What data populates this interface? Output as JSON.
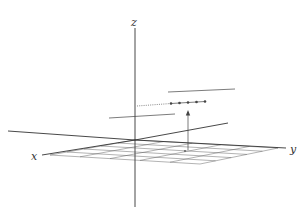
{
  "diagram": {
    "type": "3d-coordinate-axes",
    "axis_labels": {
      "x": "x",
      "y": "y",
      "z": "z"
    },
    "grid": {
      "rows": 5,
      "cols": 5,
      "plane": "xy"
    },
    "dot_count": 5,
    "elements": [
      "z-axis",
      "x-axis",
      "y-axis",
      "xy-grid",
      "upper-horizontal-segment",
      "lower-horizontal-segment",
      "dotted-projection-line",
      "row-of-dots",
      "vertical-arrow"
    ],
    "colors": {
      "line": "#333333",
      "background": "#ffffff"
    }
  }
}
